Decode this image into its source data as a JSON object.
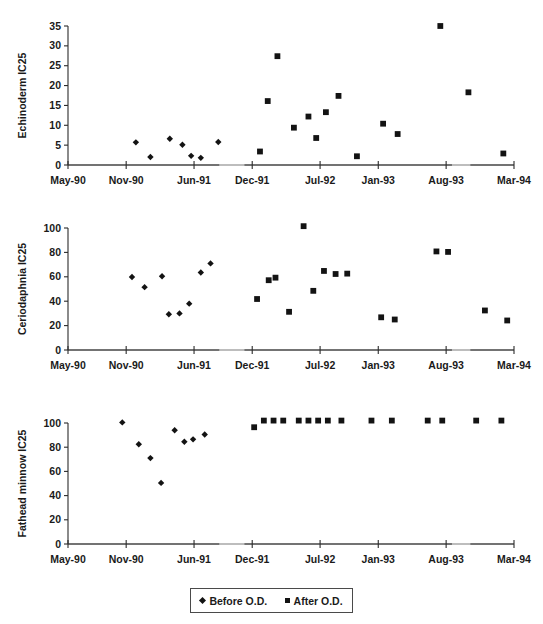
{
  "legend": {
    "before_label": "Before O.D.",
    "after_label": "After O.D.",
    "before_marker": "diamond-marker-icon",
    "after_marker": "square-marker-icon"
  },
  "colors": {
    "marker": "#131313",
    "axis": "#2b2b2b",
    "axis_soft": "#7d7d7d",
    "text": "#1a1a1a",
    "background": "#ffffff"
  },
  "x_axis": {
    "tick_labels": [
      "May-90",
      "Nov-90",
      "Jun-91",
      "Dec-91",
      "Jul-92",
      "Jan-93",
      "Aug-93",
      "Mar-94"
    ],
    "tick_months": [
      0,
      6,
      13,
      19,
      26,
      32,
      39,
      46
    ],
    "min_month": 0,
    "max_month": 46
  },
  "chart_data": [
    {
      "type": "scatter",
      "title": "",
      "id": "echinoderm",
      "ylabel": "Echinoderm IC25",
      "xlabel": "",
      "ylim": [
        0,
        35
      ],
      "yticks": [
        0,
        5,
        10,
        15,
        20,
        25,
        30,
        35
      ],
      "ytick_labels": [
        "0",
        "5",
        "10",
        "15",
        "20",
        "25",
        "30",
        "35"
      ],
      "xlim": [
        0,
        46
      ],
      "xticks": [
        0,
        6,
        13,
        19,
        26,
        32,
        39,
        46
      ],
      "xtick_labels": [
        "May-90",
        "Nov-90",
        "Jun-91",
        "Dec-91",
        "Jul-92",
        "Jan-93",
        "Aug-93",
        "Mar-94"
      ],
      "grid": false,
      "legend_position": "bottom",
      "series": [
        {
          "name": "Before O.D.",
          "marker": "diamond",
          "points": [
            {
              "x": 7.0,
              "y": 5.7
            },
            {
              "x": 8.5,
              "y": 2.0
            },
            {
              "x": 10.5,
              "y": 6.6
            },
            {
              "x": 11.8,
              "y": 5.1
            },
            {
              "x": 12.7,
              "y": 2.3
            },
            {
              "x": 13.7,
              "y": 1.8
            },
            {
              "x": 15.5,
              "y": 5.8
            }
          ]
        },
        {
          "name": "After O.D.",
          "marker": "square",
          "points": [
            {
              "x": 19.8,
              "y": 3.4
            },
            {
              "x": 20.6,
              "y": 16.1
            },
            {
              "x": 21.6,
              "y": 27.4
            },
            {
              "x": 23.3,
              "y": 9.4
            },
            {
              "x": 24.8,
              "y": 12.2
            },
            {
              "x": 25.6,
              "y": 6.8
            },
            {
              "x": 26.6,
              "y": 13.3
            },
            {
              "x": 27.9,
              "y": 17.4
            },
            {
              "x": 29.8,
              "y": 2.2
            },
            {
              "x": 32.5,
              "y": 10.4
            },
            {
              "x": 34.0,
              "y": 7.8
            },
            {
              "x": 38.4,
              "y": 35.0
            },
            {
              "x": 41.3,
              "y": 18.3
            },
            {
              "x": 44.9,
              "y": 2.9
            }
          ]
        }
      ]
    },
    {
      "type": "scatter",
      "title": "",
      "id": "ceriodaphnia",
      "ylabel": "Ceriodaphnia IC25",
      "xlabel": "",
      "ylim": [
        0,
        100
      ],
      "yticks": [
        0,
        20,
        40,
        60,
        80,
        100
      ],
      "ytick_labels": [
        "0",
        "20",
        "40",
        "60",
        "80",
        "100"
      ],
      "xlim": [
        0,
        46
      ],
      "xticks": [
        0,
        6,
        13,
        19,
        26,
        32,
        39,
        46
      ],
      "xtick_labels": [
        "May-90",
        "Nov-90",
        "Jun-91",
        "Dec-91",
        "Jul-92",
        "Jan-93",
        "Aug-93",
        "Mar-94"
      ],
      "grid": false,
      "legend_position": "bottom",
      "series": [
        {
          "name": "Before O.D.",
          "marker": "diamond",
          "points": [
            {
              "x": 6.6,
              "y": 59.8
            },
            {
              "x": 7.9,
              "y": 51.5
            },
            {
              "x": 9.7,
              "y": 60.5
            },
            {
              "x": 10.4,
              "y": 29.3
            },
            {
              "x": 11.5,
              "y": 30.0
            },
            {
              "x": 12.5,
              "y": 38.0
            },
            {
              "x": 13.7,
              "y": 63.5
            },
            {
              "x": 14.7,
              "y": 71.0
            }
          ]
        },
        {
          "name": "After O.D.",
          "marker": "square",
          "points": [
            {
              "x": 19.5,
              "y": 41.8
            },
            {
              "x": 20.7,
              "y": 57.2
            },
            {
              "x": 21.4,
              "y": 59.3
            },
            {
              "x": 22.8,
              "y": 31.3
            },
            {
              "x": 24.3,
              "y": 101.5
            },
            {
              "x": 25.3,
              "y": 48.5
            },
            {
              "x": 26.4,
              "y": 64.8
            },
            {
              "x": 27.6,
              "y": 62.3
            },
            {
              "x": 28.8,
              "y": 62.6
            },
            {
              "x": 32.3,
              "y": 26.8
            },
            {
              "x": 33.7,
              "y": 25.0
            },
            {
              "x": 38.0,
              "y": 80.8
            },
            {
              "x": 39.2,
              "y": 80.4
            },
            {
              "x": 43.0,
              "y": 32.4
            },
            {
              "x": 45.3,
              "y": 24.2
            }
          ]
        }
      ]
    },
    {
      "type": "scatter",
      "title": "",
      "id": "fathead-minnow",
      "ylabel": "Fathead minnow IC25",
      "xlabel": "",
      "ylim": [
        0,
        100
      ],
      "yticks": [
        0,
        20,
        40,
        60,
        80,
        100
      ],
      "ytick_labels": [
        "0",
        "20",
        "40",
        "60",
        "80",
        "100"
      ],
      "xlim": [
        0,
        46
      ],
      "xticks": [
        0,
        6,
        13,
        19,
        26,
        32,
        39,
        46
      ],
      "xtick_labels": [
        "May-90",
        "Nov-90",
        "Jun-91",
        "Dec-91",
        "Jul-92",
        "Jan-93",
        "Aug-93",
        "Mar-94"
      ],
      "grid": false,
      "legend_position": "bottom",
      "series": [
        {
          "name": "Before O.D.",
          "marker": "diamond",
          "points": [
            {
              "x": 5.6,
              "y": 100.5
            },
            {
              "x": 7.3,
              "y": 82.5
            },
            {
              "x": 8.5,
              "y": 71.0
            },
            {
              "x": 9.6,
              "y": 50.5
            },
            {
              "x": 11.0,
              "y": 94.0
            },
            {
              "x": 12.0,
              "y": 84.5
            },
            {
              "x": 12.9,
              "y": 86.5
            },
            {
              "x": 14.1,
              "y": 90.5
            }
          ]
        },
        {
          "name": "After O.D.",
          "marker": "square",
          "points": [
            {
              "x": 19.2,
              "y": 96.5
            },
            {
              "x": 20.2,
              "y": 102.0
            },
            {
              "x": 21.2,
              "y": 102.0
            },
            {
              "x": 22.2,
              "y": 102.0
            },
            {
              "x": 23.8,
              "y": 102.0
            },
            {
              "x": 24.8,
              "y": 102.0
            },
            {
              "x": 25.8,
              "y": 102.0
            },
            {
              "x": 26.8,
              "y": 102.0
            },
            {
              "x": 28.2,
              "y": 102.0
            },
            {
              "x": 31.3,
              "y": 102.0
            },
            {
              "x": 33.4,
              "y": 102.0
            },
            {
              "x": 37.1,
              "y": 102.0
            },
            {
              "x": 38.6,
              "y": 102.0
            },
            {
              "x": 42.1,
              "y": 102.0
            },
            {
              "x": 44.7,
              "y": 102.0
            }
          ]
        }
      ]
    }
  ]
}
